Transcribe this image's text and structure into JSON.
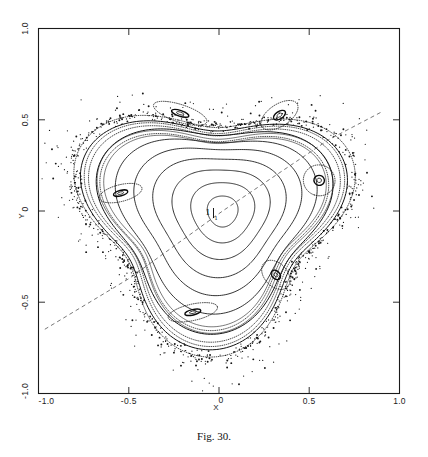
{
  "figure": {
    "caption": "Fig. 30.",
    "xlabel": "X",
    "ylabel": "Y",
    "center_point_label": "1",
    "center_point_sublabel": "1"
  },
  "axes": {
    "x_ticks": [
      {
        "value": -1.0,
        "label": "-1.0"
      },
      {
        "value": -0.5,
        "label": "-0.5"
      },
      {
        "value": 0.0,
        "label": "0"
      },
      {
        "value": 0.5,
        "label": "0.5"
      },
      {
        "value": 1.0,
        "label": "1.0"
      }
    ],
    "y_ticks": [
      {
        "value": -1.0,
        "label": "-1.0"
      },
      {
        "value": -0.5,
        "label": "-0.5"
      },
      {
        "value": 0.0,
        "label": "0"
      },
      {
        "value": 0.5,
        "label": "0.5"
      },
      {
        "value": 1.0,
        "label": "1.0"
      }
    ]
  },
  "chart_data": {
    "type": "scatter",
    "title": "Fig. 30.",
    "xlabel": "X",
    "ylabel": "Y",
    "xlim": [
      -1.0,
      1.0
    ],
    "ylim": [
      -1.0,
      1.0
    ],
    "grid": false,
    "legend": null,
    "annotations": [
      {
        "text": "1",
        "subscript": "1",
        "x": 0.02,
        "y": 0.0,
        "role": "elliptic-fixed-point"
      }
    ],
    "guide_line": {
      "style": "dashed",
      "vertices": [
        {
          "x": -0.965,
          "y": -0.648
        },
        {
          "x": -0.495,
          "y": -0.368
        },
        {
          "x": 0.02,
          "y": 0.0
        },
        {
          "x": 0.61,
          "y": 0.392
        },
        {
          "x": 0.905,
          "y": 0.545
        }
      ]
    },
    "invariant_tori": [
      {
        "name": "core-torus-1",
        "radius_x": 0.085,
        "radius_y": 0.085,
        "center": [
          0.02,
          0.0
        ]
      },
      {
        "name": "core-torus-2",
        "radius_x": 0.175,
        "radius_y": 0.165,
        "center": [
          0.02,
          0.0
        ]
      },
      {
        "name": "core-torus-3",
        "radius_x": 0.265,
        "radius_y": 0.245,
        "center": [
          0.01,
          0.0
        ]
      },
      {
        "name": "core-torus-4",
        "radius_x": 0.355,
        "radius_y": 0.325,
        "center": [
          0.0,
          -0.005
        ]
      },
      {
        "name": "core-torus-5",
        "radius_x": 0.44,
        "radius_y": 0.4,
        "center": [
          -0.01,
          -0.01
        ]
      },
      {
        "name": "core-torus-6",
        "radius_x": 0.52,
        "radius_y": 0.47,
        "center": [
          -0.02,
          -0.02
        ]
      },
      {
        "name": "outer-torus-7",
        "radius_x": 0.6,
        "radius_y": 0.545,
        "center": [
          -0.03,
          -0.03
        ]
      },
      {
        "name": "outer-torus-8",
        "radius_x": 0.665,
        "radius_y": 0.6,
        "center": [
          -0.035,
          -0.035
        ]
      }
    ],
    "island_chains": [
      {
        "name": "island-top-left",
        "center": [
          -0.215,
          0.535
        ],
        "width": 0.1,
        "height": 0.032
      },
      {
        "name": "island-top-right",
        "center": [
          0.335,
          0.525
        ],
        "width": 0.075,
        "height": 0.04
      },
      {
        "name": "island-right",
        "center": [
          0.555,
          0.168
        ],
        "width": 0.055,
        "height": 0.058
      },
      {
        "name": "island-left",
        "center": [
          -0.545,
          0.098
        ],
        "width": 0.03,
        "height": 0.08
      },
      {
        "name": "island-bottom-left",
        "center": [
          -0.145,
          -0.555
        ],
        "width": 0.09,
        "height": 0.03
      },
      {
        "name": "island-bottom-right",
        "center": [
          0.315,
          -0.35
        ],
        "width": 0.06,
        "height": 0.042
      }
    ],
    "chaotic_layer": {
      "point_count": 900,
      "description": "stochastic halo of scattered iterates surrounding the regular region"
    }
  }
}
